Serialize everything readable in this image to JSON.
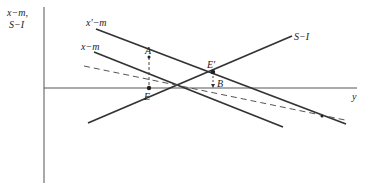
{
  "diagram": {
    "axes": {
      "y_label_line1": "x−m,",
      "y_label_line2": "S−I",
      "x_label": "y"
    },
    "curves": {
      "x_prime_minus_m": "x′−m",
      "x_minus_m": "x−m",
      "s_minus_i": "S−I"
    },
    "points": {
      "A": "A",
      "E": "E",
      "E_prime": "E′",
      "B": "B"
    },
    "colors": {
      "line": "#333333",
      "dashed": "#555555"
    }
  }
}
